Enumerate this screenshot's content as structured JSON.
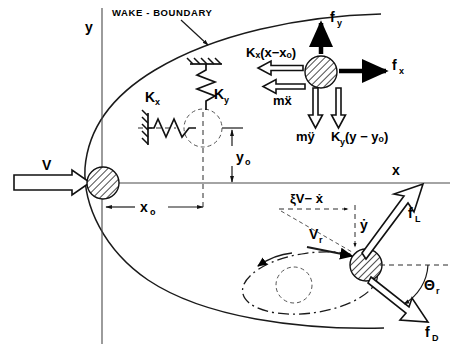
{
  "figure": {
    "title_label": "WAKE - BOUNDARY",
    "axes": {
      "y_label": "y",
      "x_label": "x"
    },
    "freestream": {
      "label": "V"
    },
    "dimensions": {
      "x_offset": "x",
      "x_offset_sub": "o",
      "y_offset": "y",
      "y_offset_sub": "o"
    },
    "springs": {
      "kx_label": "K",
      "kx_sub": "x",
      "ky_label": "K",
      "ky_sub": "y"
    },
    "upper_body_forces": {
      "spring_x": "Kₓ(x−xₒ)",
      "spring_y": "K",
      "spring_y_sub": "y",
      "spring_y_arg": "(y − yₒ)",
      "inertia_x": "mẍ",
      "inertia_y": "mÿ",
      "aero_x": "f",
      "aero_x_sub": "x",
      "aero_y": "f",
      "aero_y_sub": "y"
    },
    "lower_body_forces": {
      "relative_vel_x": "ξV− ẋ",
      "vertical_vel": "ẏ",
      "resultant_vel": "V",
      "resultant_vel_sub": "r",
      "lift": "f",
      "lift_sub": "L",
      "drag": "f",
      "drag_sub": "D",
      "angle": "Θ",
      "angle_sub": "r"
    },
    "colors": {
      "ink": "#1a1a1a",
      "axis": "#4a4a4a",
      "background": "#ffffff",
      "hatch": "#111111"
    }
  }
}
